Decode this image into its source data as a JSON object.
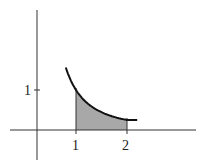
{
  "chart_data": {
    "type": "area",
    "title": "",
    "function": "y = 1/x^2",
    "shaded_interval": [
      1,
      2
    ],
    "x_ticks": [
      {
        "value": 1,
        "label": "1"
      },
      {
        "value": 2,
        "label": "2"
      }
    ],
    "y_ticks": [
      {
        "value": 1,
        "label": "1"
      }
    ],
    "curve_points": [
      [
        0.8,
        1.56
      ],
      [
        1,
        1
      ],
      [
        1.25,
        0.64
      ],
      [
        1.5,
        0.44
      ],
      [
        1.75,
        0.33
      ],
      [
        2,
        0.25
      ],
      [
        2.2,
        0.25
      ]
    ],
    "xlabel": "",
    "ylabel": "",
    "shade_color": "#a8a8a8",
    "curve_color": "#111111"
  },
  "labels": {
    "x1": "1",
    "x2": "2",
    "y1": "1"
  }
}
